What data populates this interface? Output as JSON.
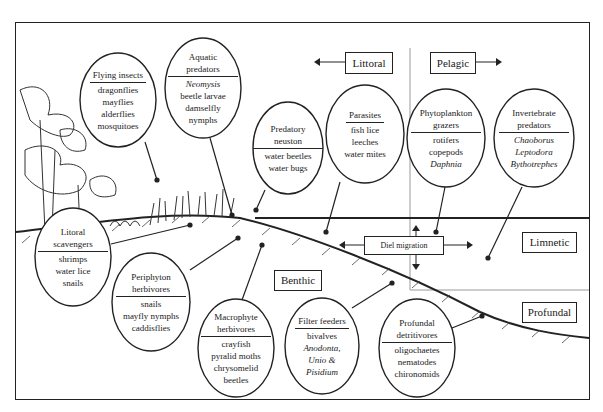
{
  "zones": {
    "littoral": "Littoral",
    "pelagic": "Pelagic",
    "limnetic": "Limnetic",
    "profundal": "Profundal",
    "benthic": "Benthic",
    "diel_migration": "Diel migration"
  },
  "groups": [
    {
      "id": "flying-insects",
      "title": "Flying insects",
      "items": [
        {
          "t": "dragonflies"
        },
        {
          "t": "mayflies"
        },
        {
          "t": "alderflies"
        },
        {
          "t": "mosquitoes"
        }
      ]
    },
    {
      "id": "aquatic-predators",
      "title": "Aquatic predators",
      "items": [
        {
          "t": "Neomysis",
          "italic": true
        },
        {
          "t": "beetle larvae"
        },
        {
          "t": "damselfly"
        },
        {
          "t": "nymphs"
        }
      ]
    },
    {
      "id": "predatory-neuston",
      "title": "Predatory neuston",
      "items": [
        {
          "t": "water beetles"
        },
        {
          "t": "water bugs"
        }
      ]
    },
    {
      "id": "parasites",
      "title": "Parasites",
      "items": [
        {
          "t": "fish lice"
        },
        {
          "t": "leeches"
        },
        {
          "t": "water mites"
        }
      ]
    },
    {
      "id": "phytoplankton-grazers",
      "title": "Phytoplankton grazers",
      "items": [
        {
          "t": "rotifers"
        },
        {
          "t": "copepods"
        },
        {
          "t": "Daphnia",
          "italic": true
        }
      ]
    },
    {
      "id": "invertebrate-predators",
      "title": "Invertebrate predators",
      "items": [
        {
          "t": "Chaoborus",
          "italic": true
        },
        {
          "t": "Leptodora",
          "italic": true
        },
        {
          "t": "Bythotrephes",
          "italic": true
        }
      ]
    },
    {
      "id": "littoral-scavengers",
      "title": "Litoral scavengers",
      "items": [
        {
          "t": "shrimps"
        },
        {
          "t": "water lice"
        },
        {
          "t": "snails"
        }
      ]
    },
    {
      "id": "periphyton-herbivores",
      "title": "Periphyton herbivores",
      "items": [
        {
          "t": "snails"
        },
        {
          "t": "mayfly nymphs"
        },
        {
          "t": "caddisflies"
        }
      ]
    },
    {
      "id": "macrophyte-herbivores",
      "title": "Macrophyte herbivores",
      "items": [
        {
          "t": "crayfish"
        },
        {
          "t": "pyralid moths"
        },
        {
          "t": "chrysomelid"
        },
        {
          "t": "beetles"
        }
      ]
    },
    {
      "id": "filter-feeders",
      "title": "Filter feeders",
      "items": [
        {
          "t": "bivalves"
        },
        {
          "t": "Anodonta,",
          "italic": true
        },
        {
          "t": "Unio &",
          "italic": true
        },
        {
          "t": "Pisidium",
          "italic": true
        }
      ]
    },
    {
      "id": "profundal-detritivores",
      "title": "Profundal detritivores",
      "items": [
        {
          "t": "oligochaetes"
        },
        {
          "t": "nematodes"
        },
        {
          "t": "chironomids"
        }
      ]
    }
  ],
  "colors": {
    "ink": "#222222",
    "divider": "#999999",
    "background": "#ffffff"
  }
}
